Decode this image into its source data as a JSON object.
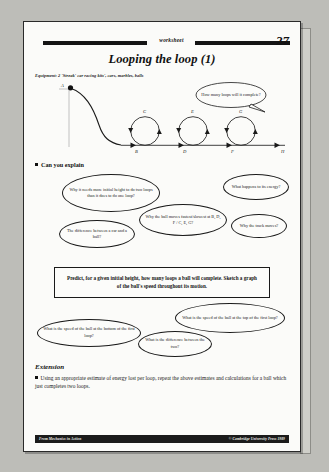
{
  "header": {
    "worksheet_word": "worksheet",
    "page_number": "27",
    "title": "Looping the loop (1)"
  },
  "equipment": "Equipment: 2 'Streak' car racing kits', cars, marbles, balls",
  "diagram": {
    "point_labels": [
      "A",
      "B",
      "C",
      "D",
      "E",
      "F",
      "G",
      "H"
    ],
    "top_bubble": "How many loops will it complete?"
  },
  "can_you_explain": {
    "heading": "Can you explain",
    "bubbles": [
      "Why it needs more initial height to do two loops than it does to do one loop?",
      "What happens to its energy?",
      "Why the ball moves fastest/slowest at B, D, F / C, E, G?",
      "Why the track moves?",
      "The difference between a car and a ball?"
    ]
  },
  "predict": "Predict, for a given initial height, how many loops a ball will complete. Sketch a graph of the ball's speed throughout its motion.",
  "speed_bubbles": [
    "What is the speed of the ball at the bottom of the first loop?",
    "What is the speed of the ball at the top of the first loop?",
    "What is the difference between the two?"
  ],
  "extension": {
    "heading": "Extension",
    "item": "Using an appropriate estimate of energy lost per loop, repeat the above estimates and calculations for a ball which just completes two loops."
  },
  "footer": {
    "left": "From Mechanics in Action",
    "right": "© Cambridge University Press 1989"
  }
}
